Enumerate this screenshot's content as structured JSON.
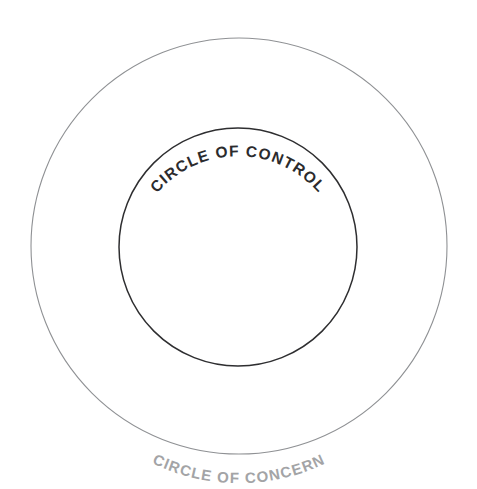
{
  "diagram": {
    "background_color": "#ffffff",
    "outer_circle": {
      "label": "CIRCLE OF CONCERN",
      "stroke_color": "#8f9194",
      "text_color": "#a3a4a6",
      "center_x": 239,
      "center_y": 246,
      "radius": 208,
      "label_position": "bottom-arc"
    },
    "inner_circle": {
      "label": "CIRCLE OF CONTROL",
      "stroke_color": "#2e2e30",
      "text_color": "#2b2b2d",
      "center_x": 238,
      "center_y": 247,
      "radius": 119,
      "label_position": "top-arc"
    }
  }
}
